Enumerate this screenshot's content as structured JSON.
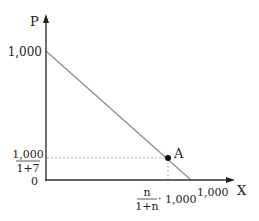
{
  "diagram": {
    "axes": {
      "y_label": "P",
      "x_label": "X",
      "origin_label": "0"
    },
    "y_ticks": {
      "top": "1,000",
      "fraction_numerator": "1,000",
      "fraction_denominator": "1+7"
    },
    "x_ticks": {
      "fraction_numerator": "n",
      "fraction_denominator": "1+n",
      "multiplier": "· 1,000",
      "right": "1,000"
    },
    "point": {
      "label": "A"
    },
    "colors": {
      "axis": "#222222",
      "line": "#8a8a8a",
      "dotted": "#aaaaaa",
      "point": "#111111"
    }
  }
}
